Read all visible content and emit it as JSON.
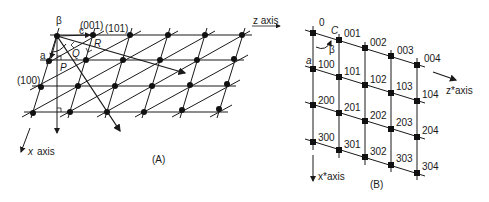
{
  "panelA": {
    "caption": "(A)",
    "labels": {
      "beta": "β",
      "plane_001": "(001)",
      "plane_101": "(101)",
      "plane_100": "(100)",
      "c": "c",
      "a": "a",
      "R": "R",
      "Q": "Q",
      "P": "P",
      "z_axis": "z axis",
      "x_axis_x": "x",
      "x_axis_word": "axis"
    }
  },
  "panelB": {
    "caption": "(B)",
    "labels": {
      "origin": "0",
      "c": "C",
      "a": "a",
      "beta": "β",
      "zstar_axis": "z*axis",
      "xstar_axis": "x*axis"
    },
    "points": [
      [
        "001",
        "002",
        "003",
        "004"
      ],
      [
        "100",
        "101",
        "102",
        "103",
        "104"
      ],
      [
        "200",
        "201",
        "202",
        "203",
        "204"
      ],
      [
        "300",
        "301",
        "302",
        "303",
        "304"
      ]
    ]
  }
}
